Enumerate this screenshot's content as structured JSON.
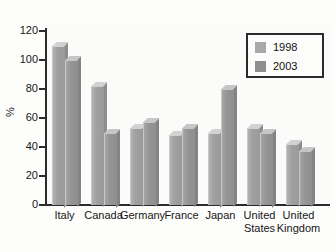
{
  "chart_data": {
    "type": "bar",
    "title": "",
    "subtitle": "",
    "xlabel": "",
    "ylabel": "%",
    "ylim": [
      0,
      120
    ],
    "yticks": [
      0,
      20,
      40,
      60,
      80,
      100,
      120
    ],
    "ytick_labels": [
      "0",
      "20",
      "40",
      "60",
      "80",
      "100",
      "120"
    ],
    "grid": false,
    "legend_position": "top-right",
    "categories": [
      "Italy",
      "Canada",
      "Germany",
      "France",
      "Japan",
      "United States",
      "United Kingdom"
    ],
    "category_lines": [
      [
        "Italy"
      ],
      [
        "Canada"
      ],
      [
        "Germany"
      ],
      [
        "France"
      ],
      [
        "Japan"
      ],
      [
        "United",
        "States"
      ],
      [
        "United",
        "Kingdom"
      ]
    ],
    "series": [
      {
        "name": "1998",
        "color": "#a8a8a8",
        "values": [
          110,
          82,
          53,
          48,
          50,
          53,
          42
        ]
      },
      {
        "name": "2003",
        "color": "#8f8f8f",
        "values": [
          100,
          50,
          57,
          53,
          80,
          50,
          37
        ]
      }
    ]
  },
  "legend": {
    "entries": [
      {
        "label": "1998",
        "color": "#a8a8a8"
      },
      {
        "label": "2003",
        "color": "#8f8f8f"
      }
    ]
  },
  "axis": {
    "y_title": "%",
    "tick_labels": [
      "120",
      "100",
      "80",
      "60",
      "40",
      "20",
      "0"
    ]
  },
  "x_labels": [
    {
      "line1": "Italy",
      "line2": ""
    },
    {
      "line1": "Canada",
      "line2": ""
    },
    {
      "line1": "Germany",
      "line2": ""
    },
    {
      "line1": "France",
      "line2": ""
    },
    {
      "line1": "Japan",
      "line2": ""
    },
    {
      "line1": "United",
      "line2": "States"
    },
    {
      "line1": "United",
      "line2": "Kingdom"
    }
  ],
  "colors": {
    "background": "#fdfdfc",
    "axis": "#2b2b2b",
    "text": "#161616",
    "bar_1998": "#a8a8a8",
    "bar_2003": "#8f8f8f"
  }
}
